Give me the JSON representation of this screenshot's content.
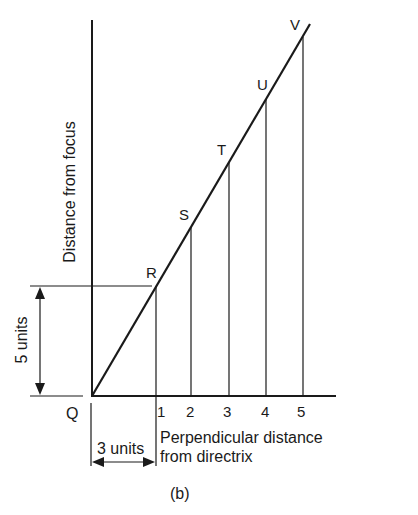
{
  "figure": {
    "caption": "(b)",
    "origin_label": "Q",
    "y_axis_label": "Distance from focus",
    "x_axis_label_line1": "Perpendicular distance",
    "x_axis_label_line2": "from directrix",
    "dim_vertical": "5 units",
    "dim_horizontal": "3 units",
    "x_ticks": [
      "1",
      "2",
      "3",
      "4",
      "5"
    ],
    "points": [
      {
        "label": "R"
      },
      {
        "label": "S"
      },
      {
        "label": "T"
      },
      {
        "label": "U"
      },
      {
        "label": "V"
      }
    ]
  }
}
